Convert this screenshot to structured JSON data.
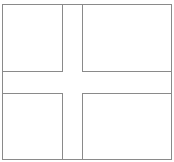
{
  "figure": {
    "type": "nordic-cross-flag-outline",
    "stroke_color": "#8a8a8a",
    "fill_color": "#ffffff",
    "outer": {
      "x": 2.5,
      "y": 4.5,
      "w": 169,
      "h": 155
    },
    "cross": {
      "v_left": 62.5,
      "v_right": 82.5,
      "h_top": 71.5,
      "h_bottom": 93.5
    }
  }
}
